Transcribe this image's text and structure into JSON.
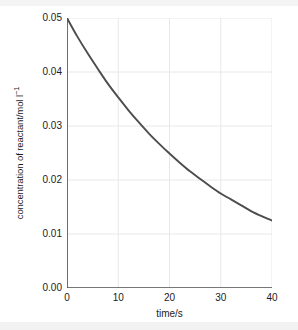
{
  "chart_data": {
    "type": "line",
    "title": "",
    "xlabel": "time/s",
    "ylabel_plain": "concentration of reactant/mol l-1",
    "ylabel_prefix": "concentration of reactant/mol l",
    "ylabel_superscript": "−1",
    "xlim": [
      0,
      40
    ],
    "ylim": [
      0,
      0.05
    ],
    "x_ticks": [
      0,
      10,
      20,
      30,
      40
    ],
    "x_tick_labels": [
      "0",
      "10",
      "20",
      "30",
      "40"
    ],
    "x_minor_ticks": [
      5,
      15,
      25,
      35
    ],
    "y_ticks": [
      0.0,
      0.01,
      0.02,
      0.03,
      0.04,
      0.05
    ],
    "y_tick_labels": [
      "0.00",
      "0.01",
      "0.02",
      "0.03",
      "0.04",
      "0.05"
    ],
    "y_minor_ticks": [
      0.005,
      0.015,
      0.025,
      0.035,
      0.045
    ],
    "grid": true,
    "legend": "none",
    "series": [
      {
        "name": "concentration of reactant",
        "color": "#4d4d4d",
        "x": [
          0,
          2,
          4,
          6,
          8,
          10,
          12,
          14,
          16,
          18,
          20,
          22,
          24,
          26,
          28,
          30,
          32,
          34,
          36,
          38,
          40
        ],
        "values": [
          0.05,
          0.0466,
          0.0435,
          0.0406,
          0.0378,
          0.0353,
          0.0329,
          0.0307,
          0.0286,
          0.0267,
          0.0249,
          0.0232,
          0.0216,
          0.0202,
          0.0188,
          0.0175,
          0.0164,
          0.0153,
          0.0142,
          0.0133,
          0.0125
        ]
      }
    ]
  },
  "style": {
    "curve_color": "#4d4d4d",
    "axis_color": "#4a4a4a",
    "grid_color": "#e8e8ec",
    "text_color": "#1b1b1b",
    "background": "#ffffff",
    "band_color": "#f2f2f2"
  }
}
